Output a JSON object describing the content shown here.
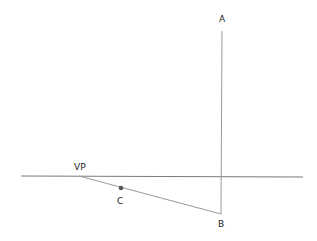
{
  "diagram": {
    "type": "one-point perspective construction",
    "colors": {
      "background": "#ffffff",
      "horizon": "#7a7a7a",
      "lines": "#9a9a9a",
      "point": "#555555",
      "text": "#222222"
    },
    "labels": {
      "A": "A",
      "B": "B",
      "C": "C",
      "VP": "VP"
    },
    "points": {
      "A": {
        "x": 222,
        "y": 31
      },
      "B": {
        "x": 221,
        "y": 214
      },
      "C": {
        "x": 121,
        "y": 188
      },
      "VP": {
        "x": 79,
        "y": 176
      }
    },
    "horizon_line": {
      "x1": 21,
      "y1": 176,
      "x2": 303,
      "y2": 177
    }
  }
}
